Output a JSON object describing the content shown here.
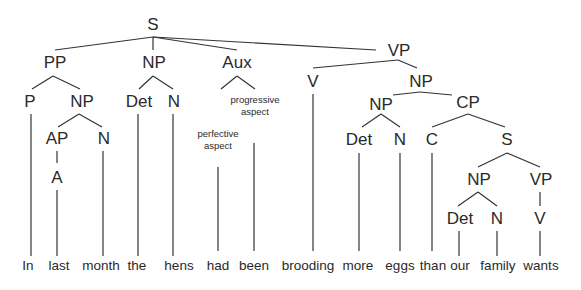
{
  "diagram": {
    "type": "syntax-tree",
    "nodes": {
      "s_root": "S",
      "pp": "PP",
      "np_subj": "NP",
      "aux": "Aux",
      "vp": "VP",
      "p": "P",
      "np_pp": "NP",
      "det_subj": "Det",
      "n_subj": "N",
      "ap": "AP",
      "n_pp": "N",
      "a": "A",
      "v": "V",
      "np_obj": "NP",
      "np_inner": "NP",
      "cp": "CP",
      "det_obj": "Det",
      "n_obj": "N",
      "c": "C",
      "s_emb": "S",
      "np_emb": "NP",
      "vp_emb": "VP",
      "det_emb": "Det",
      "n_emb": "N",
      "v_emb": "V"
    },
    "annotations": {
      "progressive_line1": "progressive",
      "progressive_line2": "aspect",
      "perfective_line1": "perfective",
      "perfective_line2": "aspect"
    },
    "words": [
      "In",
      "last",
      "month",
      "the",
      "hens",
      "had",
      "been",
      "brooding",
      "more",
      "eggs",
      "than",
      "our",
      "family",
      "wants"
    ]
  }
}
